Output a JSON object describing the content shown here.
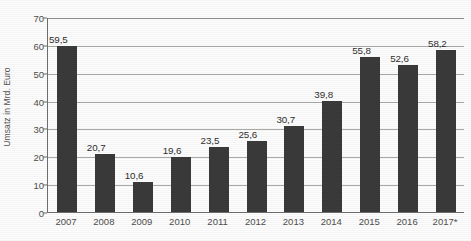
{
  "chart_data": {
    "type": "bar",
    "title": "",
    "subtitle": "",
    "xlabel": "",
    "ylabel": "Umsatz in Mrd. Euro",
    "ylim": [
      0,
      70
    ],
    "ytick_step": 10,
    "yticks": [
      "70",
      "60",
      "50",
      "40",
      "30",
      "20",
      "10",
      "0"
    ],
    "grid": true,
    "legend": false,
    "legend_position": "none",
    "categories": [
      "2007",
      "2008",
      "2009",
      "2010",
      "2011",
      "2012",
      "2013",
      "2014",
      "2015",
      "2016",
      "2017*"
    ],
    "values": [
      59.5,
      20.7,
      10.6,
      19.6,
      23.5,
      25.6,
      30.7,
      39.8,
      55.8,
      52.6,
      58.2
    ],
    "value_labels": [
      "59,5",
      "20,7",
      "10,6",
      "19,6",
      "23,5",
      "25,6",
      "30,7",
      "39,8",
      "55,8",
      "52,6",
      "58,2"
    ],
    "bar_color": "#3a3a3a",
    "gridline_color": "#a9a9a6",
    "axis_color": "#6e6e6c",
    "background_color": "#fdfdfd",
    "annotations": [
      "* = Prognosewert (Sternchen am Jahr 2017)"
    ]
  }
}
